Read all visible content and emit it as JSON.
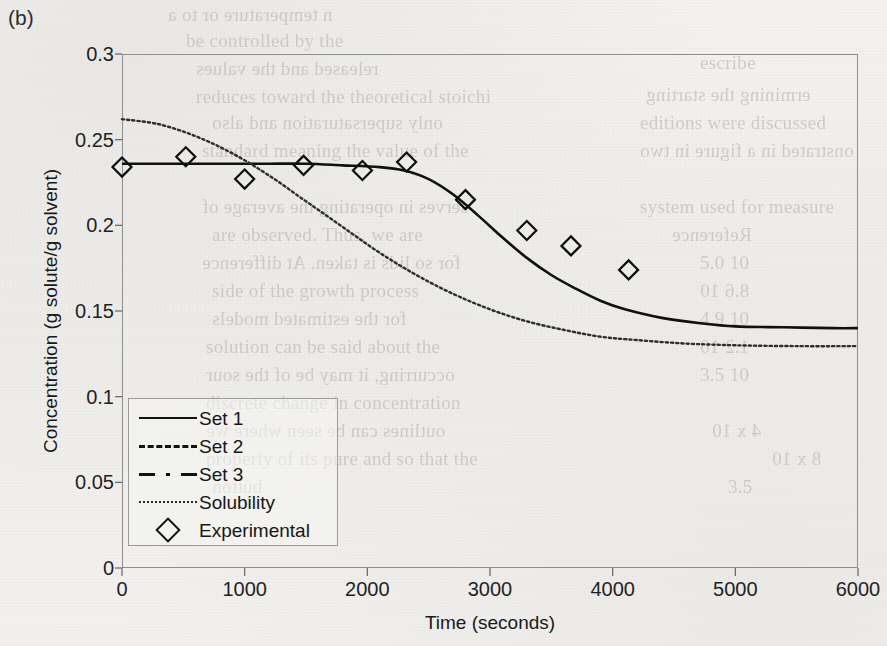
{
  "panel": {
    "label": "(b)"
  },
  "axes": {
    "x_label": "Time (seconds)",
    "y_label": "Concentration (g solute/g solvent)",
    "x_ticks": [
      "0",
      "1000",
      "2000",
      "3000",
      "4000",
      "5000",
      "6000"
    ],
    "y_ticks": [
      "0.3",
      "0.25",
      "0.2",
      "0.15",
      "0.1",
      "0.05",
      "0"
    ]
  },
  "legend": {
    "items": [
      {
        "label": "Set 1",
        "key": "solid-line-icon"
      },
      {
        "label": "Set 2",
        "key": "dashed-line-icon"
      },
      {
        "label": "Set 3",
        "key": "dash-dot-line-icon"
      },
      {
        "label": "Solubility",
        "key": "dotted-line-icon"
      },
      {
        "label": "Experimental",
        "key": "diamond-marker-icon"
      }
    ]
  },
  "ghost_text": [
    {
      "text": "n temperature or to a",
      "x": 168,
      "y": 4,
      "size": 19
    },
    {
      "text": "be controlled by the",
      "x": 186,
      "y": 30,
      "size": 19
    },
    {
      "text": "released and the values",
      "x": 196,
      "y": 58,
      "size": 19
    },
    {
      "text": "reduces toward the theoretical stoichi",
      "x": 196,
      "y": 86,
      "size": 19
    },
    {
      "text": "only supersaturation and also",
      "x": 212,
      "y": 112,
      "size": 19
    },
    {
      "text": "standard meaning the value of the",
      "x": 202,
      "y": 140,
      "size": 19
    },
    {
      "text": "serves in operating the average of",
      "x": 202,
      "y": 196,
      "size": 19
    },
    {
      "text": "are observed. Thus, we are",
      "x": 212,
      "y": 224,
      "size": 19
    },
    {
      "text": "for so lids is taken. At difference",
      "x": 202,
      "y": 252,
      "size": 19
    },
    {
      "text": "side of the growth process",
      "x": 212,
      "y": 280,
      "size": 19
    },
    {
      "text": "for the estimated models",
      "x": 212,
      "y": 308,
      "size": 19
    },
    {
      "text": "solution can be said about the",
      "x": 206,
      "y": 336,
      "size": 19
    },
    {
      "text": "occurring, it may be of the sour",
      "x": 206,
      "y": 364,
      "size": 19
    },
    {
      "text": "discrete change in concentration",
      "x": 206,
      "y": 392,
      "size": 19
    },
    {
      "text": "outlines can be seen where we",
      "x": 206,
      "y": 420,
      "size": 19
    },
    {
      "text": "property of its pure and so that the",
      "x": 206,
      "y": 448,
      "size": 19
    },
    {
      "text": "button",
      "x": 212,
      "y": 476,
      "size": 19
    },
    {
      "text": "escribe",
      "x": 700,
      "y": 52,
      "size": 19
    },
    {
      "text": "ermining the starting",
      "x": 646,
      "y": 84,
      "size": 19
    },
    {
      "text": "editions were discussed",
      "x": 640,
      "y": 112,
      "size": 19
    },
    {
      "text": "onstrated in a figure in two",
      "x": 640,
      "y": 140,
      "size": 19
    },
    {
      "text": "system used for measure",
      "x": 640,
      "y": 196,
      "size": 19
    },
    {
      "text": "Reference",
      "x": 672,
      "y": 224,
      "size": 19
    },
    {
      "text": "5.0 10",
      "x": 700,
      "y": 252,
      "size": 19
    },
    {
      "text": "8.6 10",
      "x": 700,
      "y": 280,
      "size": 19
    },
    {
      "text": "4.9 10",
      "x": 700,
      "y": 308,
      "size": 19
    },
    {
      "text": "1.2 10",
      "x": 700,
      "y": 336,
      "size": 19
    },
    {
      "text": "3.5 10",
      "x": 700,
      "y": 364,
      "size": 19
    },
    {
      "text": "4 x 10",
      "x": 712,
      "y": 420,
      "size": 19
    },
    {
      "text": "3.5",
      "x": 728,
      "y": 476,
      "size": 19
    },
    {
      "text": "8 x 10",
      "x": 772,
      "y": 448,
      "size": 19
    }
  ],
  "chart_data": {
    "type": "line",
    "title": "(b)",
    "xlabel": "Time (seconds)",
    "ylabel": "Concentration (g solute/g solvent)",
    "xlim": [
      0,
      6000
    ],
    "ylim": [
      0,
      0.3
    ],
    "grid": false,
    "legend_position": "inside-lower-left",
    "series": [
      {
        "name": "Set 1",
        "style": "solid",
        "x": [
          0,
          300,
          600,
          900,
          1200,
          1500,
          1800,
          2100,
          2300,
          2500,
          2700,
          2900,
          3100,
          3300,
          3500,
          3700,
          3900,
          4100,
          4400,
          4700,
          5000,
          5400,
          5800,
          6000
        ],
        "y": [
          0.236,
          0.236,
          0.236,
          0.236,
          0.236,
          0.236,
          0.235,
          0.234,
          0.232,
          0.227,
          0.218,
          0.206,
          0.193,
          0.181,
          0.171,
          0.163,
          0.156,
          0.151,
          0.146,
          0.143,
          0.141,
          0.1405,
          0.14,
          0.14
        ]
      },
      {
        "name": "Set 2",
        "style": "dashed",
        "note": "overlaps Set 1 (not visually separable)",
        "x": [
          0,
          6000
        ],
        "y": [
          0.236,
          0.14
        ]
      },
      {
        "name": "Set 3",
        "style": "dash-dot",
        "note": "overlaps Set 1 (not visually separable)",
        "x": [
          0,
          6000
        ],
        "y": [
          0.236,
          0.14
        ]
      },
      {
        "name": "Solubility",
        "style": "dotted",
        "x": [
          0,
          300,
          600,
          900,
          1200,
          1500,
          1800,
          2100,
          2400,
          2700,
          3000,
          3300,
          3600,
          3900,
          4200,
          4600,
          5000,
          5500,
          6000
        ],
        "y": [
          0.262,
          0.259,
          0.252,
          0.242,
          0.229,
          0.214,
          0.199,
          0.184,
          0.171,
          0.16,
          0.151,
          0.144,
          0.139,
          0.135,
          0.133,
          0.131,
          0.13,
          0.1295,
          0.1295
        ]
      }
    ],
    "scatter": {
      "name": "Experimental",
      "marker": "diamond",
      "x": [
        0,
        520,
        1000,
        1480,
        1960,
        2320,
        2800,
        3300,
        3660,
        4130
      ],
      "y": [
        0.234,
        0.24,
        0.227,
        0.235,
        0.232,
        0.237,
        0.215,
        0.197,
        0.188,
        0.174
      ]
    }
  }
}
